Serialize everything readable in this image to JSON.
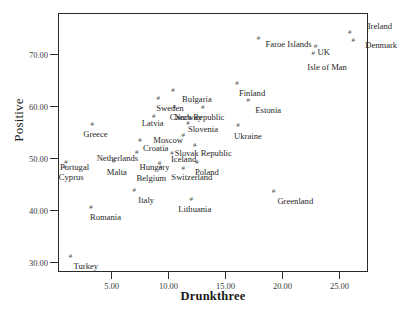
{
  "chart_data": {
    "type": "scatter",
    "title": "",
    "xlabel": "Drunkthree",
    "ylabel": "Positive",
    "xlim": [
      0.3,
      27.5
    ],
    "ylim": [
      28.2,
      78.0
    ],
    "xticks": [
      "5.00",
      "10.00",
      "15.00",
      "20.00",
      "25.00"
    ],
    "xtick_values": [
      5,
      10,
      15,
      20,
      25
    ],
    "yticks": [
      "30.00",
      "40.00",
      "50.00",
      "60.00",
      "70.00"
    ],
    "ytick_values": [
      30,
      40,
      50,
      60,
      70
    ],
    "grid": false,
    "legend": null,
    "marker": "#",
    "points": [
      {
        "label": "Ireland",
        "x": 25.9,
        "y": 74.3,
        "lx": 18,
        "ly": -10
      },
      {
        "label": "Denmark",
        "x": 26.2,
        "y": 72.9,
        "lx": 12,
        "ly": 1
      },
      {
        "label": "Faroe Islands",
        "x": 17.9,
        "y": 73.1,
        "lx": 7,
        "ly": 2
      },
      {
        "label": "UK",
        "x": 22.9,
        "y": 71.6,
        "lx": 2,
        "ly": 2
      },
      {
        "label": "Isle of Man",
        "x": 22.7,
        "y": 70.4,
        "lx": -6,
        "ly": 10
      },
      {
        "label": "Finland",
        "x": 16.0,
        "y": 64.6,
        "lx": 2,
        "ly": 6
      },
      {
        "label": "Bulgaria",
        "x": 10.4,
        "y": 63.1,
        "lx": 9,
        "ly": 5
      },
      {
        "label": "Estonia",
        "x": 17.0,
        "y": 61.3,
        "lx": 7,
        "ly": 6
      },
      {
        "label": "Sweden",
        "x": 9.1,
        "y": 61.6,
        "lx": -2,
        "ly": 6
      },
      {
        "label": "Norway",
        "x": 10.5,
        "y": 59.9,
        "lx": 0,
        "ly": 6
      },
      {
        "label": "Czech Republic",
        "x": 13.0,
        "y": 59.9,
        "lx": -33,
        "ly": 6
      },
      {
        "label": "Latvia",
        "x": 8.7,
        "y": 58.2,
        "lx": -12,
        "ly": 3
      },
      {
        "label": "Slovenia",
        "x": 11.7,
        "y": 56.8,
        "lx": 0,
        "ly": 2
      },
      {
        "label": "Ukraine",
        "x": 16.1,
        "y": 56.5,
        "lx": -4,
        "ly": 7
      },
      {
        "label": "Greece",
        "x": 3.3,
        "y": 56.6,
        "lx": -9,
        "ly": 6
      },
      {
        "label": "Moscow",
        "x": 11.3,
        "y": 54.6,
        "lx": -30,
        "ly": 1
      },
      {
        "label": "Croatia",
        "x": 7.5,
        "y": 53.6,
        "lx": 3,
        "ly": 4
      },
      {
        "label": "Slovak Republic",
        "x": 12.3,
        "y": 52.6,
        "lx": -20,
        "ly": 4
      },
      {
        "label": "Netherlands",
        "x": 7.2,
        "y": 51.3,
        "lx": -40,
        "ly": 2
      },
      {
        "label": "Iceland",
        "x": 10.3,
        "y": 51.0,
        "lx": -1,
        "ly": 2
      },
      {
        "label": "Portugal",
        "x": 1.0,
        "y": 49.4,
        "lx": -6,
        "ly": 1
      },
      {
        "label": "Hungary",
        "x": 9.2,
        "y": 49.2,
        "lx": -20,
        "ly": 0
      },
      {
        "label": "Poland",
        "x": 12.5,
        "y": 49.4,
        "lx": -2,
        "ly": 6
      },
      {
        "label": "Malta",
        "x": 5.2,
        "y": 49.5,
        "lx": -7,
        "ly": 7
      },
      {
        "label": "Switzerland",
        "x": 11.3,
        "y": 48.2,
        "lx": -12,
        "ly": 5
      },
      {
        "label": "Cyprus",
        "x": 0.9,
        "y": 48.3,
        "lx": -6,
        "ly": 6
      },
      {
        "label": "Belgium",
        "x": 9.3,
        "y": 48.4,
        "lx": -24,
        "ly": 7
      },
      {
        "label": "Italy",
        "x": 7.0,
        "y": 44.0,
        "lx": 4,
        "ly": 6
      },
      {
        "label": "Greenland",
        "x": 19.2,
        "y": 43.8,
        "lx": 4,
        "ly": 6
      },
      {
        "label": "Lithuania",
        "x": 12.0,
        "y": 42.3,
        "lx": -13,
        "ly": 6
      },
      {
        "label": "Romania",
        "x": 3.2,
        "y": 40.7,
        "lx": -1,
        "ly": 6
      },
      {
        "label": "Turkey",
        "x": 1.4,
        "y": 31.3,
        "lx": 3,
        "ly": 6
      }
    ]
  }
}
